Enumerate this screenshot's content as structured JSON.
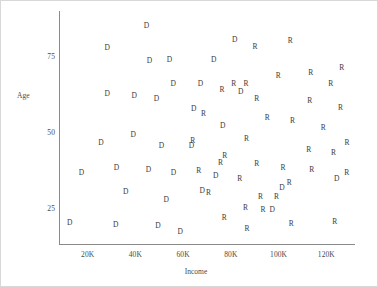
{
  "chart_data": {
    "type": "scatter",
    "title": "",
    "xlabel": "Income",
    "ylabel": "Age",
    "xlim": [
      8000,
      132000
    ],
    "ylim": [
      13,
      90
    ],
    "grid": false,
    "legend": "none",
    "xticks": [
      "20K",
      "40K",
      "60K",
      "80K",
      "100K",
      "120K"
    ],
    "xtick_values": [
      20000,
      40000,
      60000,
      80000,
      100000,
      120000
    ],
    "yticks": [
      "75",
      "50",
      "25"
    ],
    "ytick_values": [
      75,
      50,
      25
    ],
    "marker_encoding": "text label: D = Democrat, R = Republican",
    "series": [
      {
        "name": "D",
        "label": "D",
        "color": "#3b3b3b",
        "points": [
          {
            "x": 44600,
            "y": 85.2
          },
          {
            "x": 28200,
            "y": 77.7
          },
          {
            "x": 45900,
            "y": 73.4
          },
          {
            "x": 54300,
            "y": 73.8
          },
          {
            "x": 72800,
            "y": 73.8
          },
          {
            "x": 55900,
            "y": 66.0
          },
          {
            "x": 67300,
            "y": 66.0
          },
          {
            "x": 81600,
            "y": 80.3
          },
          {
            "x": 84100,
            "y": 63.1
          },
          {
            "x": 28200,
            "y": 62.6
          },
          {
            "x": 39500,
            "y": 61.9
          },
          {
            "x": 48800,
            "y": 61.0
          },
          {
            "x": 64400,
            "y": 57.5
          },
          {
            "x": 39100,
            "y": 48.9
          },
          {
            "x": 25600,
            "y": 46.5
          },
          {
            "x": 50900,
            "y": 45.3
          },
          {
            "x": 63500,
            "y": 45.3
          },
          {
            "x": 76600,
            "y": 52.0
          },
          {
            "x": 73700,
            "y": 35.4
          },
          {
            "x": 17400,
            "y": 36.4
          },
          {
            "x": 32100,
            "y": 38.0
          },
          {
            "x": 45500,
            "y": 37.6
          },
          {
            "x": 56000,
            "y": 36.4
          },
          {
            "x": 36000,
            "y": 30.1
          },
          {
            "x": 52900,
            "y": 27.7
          },
          {
            "x": 68000,
            "y": 30.5
          },
          {
            "x": 12500,
            "y": 20.0
          },
          {
            "x": 31800,
            "y": 19.2
          },
          {
            "x": 49500,
            "y": 18.8
          },
          {
            "x": 58800,
            "y": 16.9
          },
          {
            "x": 124300,
            "y": 34.6
          },
          {
            "x": 101400,
            "y": 31.6
          },
          {
            "x": 97300,
            "y": 24.1
          }
        ]
      },
      {
        "name": "R",
        "label": "R",
        "color": "#3b3b3b",
        "points": [
          {
            "x": 104900,
            "y": 80.0
          },
          {
            "x": 90100,
            "y": 78.0
          },
          {
            "x": 113500,
            "y": 69.6
          },
          {
            "x": 99900,
            "y": 68.5
          },
          {
            "x": 126500,
            "y": 71.1
          },
          {
            "x": 86300,
            "y": 66.0
          },
          {
            "x": 121800,
            "y": 66.0
          },
          {
            "x": 81200,
            "y": 66.0
          },
          {
            "x": 76300,
            "y": 64.0
          },
          {
            "x": 90900,
            "y": 61.0
          },
          {
            "x": 113000,
            "y": 60.2
          },
          {
            "x": 125900,
            "y": 58.0
          },
          {
            "x": 68500,
            "y": 56.0
          },
          {
            "x": 95200,
            "y": 54.8
          },
          {
            "x": 105800,
            "y": 53.5
          },
          {
            "x": 118700,
            "y": 51.2
          },
          {
            "x": 86600,
            "y": 47.6
          },
          {
            "x": 64000,
            "y": 47.0
          },
          {
            "x": 128700,
            "y": 46.5
          },
          {
            "x": 112600,
            "y": 44.2
          },
          {
            "x": 77400,
            "y": 42.2
          },
          {
            "x": 123000,
            "y": 43.0
          },
          {
            "x": 75700,
            "y": 39.9
          },
          {
            "x": 90800,
            "y": 39.6
          },
          {
            "x": 101800,
            "y": 38.0
          },
          {
            "x": 113900,
            "y": 37.5
          },
          {
            "x": 128600,
            "y": 36.4
          },
          {
            "x": 66500,
            "y": 37.0
          },
          {
            "x": 83700,
            "y": 34.6
          },
          {
            "x": 104500,
            "y": 33.0
          },
          {
            "x": 70600,
            "y": 30.0
          },
          {
            "x": 92400,
            "y": 28.4
          },
          {
            "x": 99100,
            "y": 28.4
          },
          {
            "x": 86100,
            "y": 24.8
          },
          {
            "x": 93500,
            "y": 24.4
          },
          {
            "x": 77200,
            "y": 21.6
          },
          {
            "x": 105300,
            "y": 19.7
          },
          {
            "x": 123500,
            "y": 20.4
          },
          {
            "x": 86800,
            "y": 18.0
          }
        ]
      }
    ]
  }
}
